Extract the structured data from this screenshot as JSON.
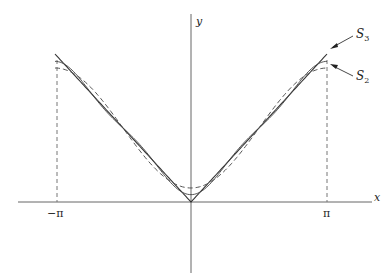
{
  "figure": {
    "axes": {
      "x_label": "x",
      "y_label": "y",
      "x_ticks": [
        {
          "label": "−π",
          "value": -3.14159
        },
        {
          "label": "π",
          "value": 3.14159
        }
      ]
    },
    "curves": [
      {
        "name": "f(x) = |x|",
        "style": "solid",
        "type": "abs"
      },
      {
        "name": "S3",
        "style": "solid-thin",
        "terms": 3
      },
      {
        "name": "S2",
        "style": "dashed",
        "terms": 2
      }
    ],
    "annotations": [
      {
        "label_main": "S",
        "label_sub": "3",
        "points_to": "S3"
      },
      {
        "label_main": "S",
        "label_sub": "2",
        "points_to": "S2"
      }
    ],
    "colors": {
      "axis": "#555555",
      "curve": "#333333",
      "dashed": "#555555"
    }
  },
  "chart_data": {
    "type": "line",
    "title": "",
    "xlabel": "x",
    "ylabel": "y",
    "xlim": [
      -3.6,
      4.4
    ],
    "ylim": [
      -1.5,
      3.8
    ],
    "grid": false,
    "series": [
      {
        "name": "|x|",
        "x": [
          -3.14159,
          0,
          3.14159
        ],
        "values": [
          3.14159,
          0,
          3.14159
        ]
      },
      {
        "name": "S3",
        "x": [
          -3.14159,
          -1.5708,
          0,
          1.5708,
          3.14159
        ],
        "values": [
          2.985,
          1.571,
          0.156,
          1.571,
          2.985
        ]
      },
      {
        "name": "S2",
        "x": [
          -3.14159,
          -1.5708,
          0,
          1.5708,
          3.14159
        ],
        "values": [
          2.844,
          1.571,
          0.298,
          1.571,
          2.844
        ]
      }
    ],
    "legend": [
      "S3",
      "S2"
    ]
  }
}
